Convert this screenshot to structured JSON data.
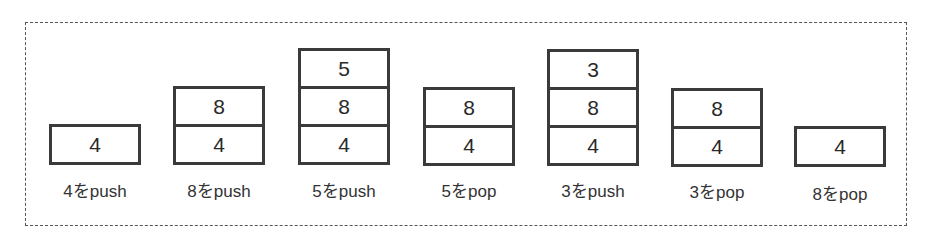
{
  "diagram": {
    "title": "",
    "steps": [
      {
        "label": "4をpush",
        "stack": [
          "4"
        ]
      },
      {
        "label": "8をpush",
        "stack": [
          "8",
          "4"
        ]
      },
      {
        "label": "5をpush",
        "stack": [
          "5",
          "8",
          "4"
        ]
      },
      {
        "label": "5をpop",
        "stack": [
          "8",
          "4"
        ]
      },
      {
        "label": "3をpush",
        "stack": [
          "3",
          "8",
          "4"
        ]
      },
      {
        "label": "3をpop",
        "stack": [
          "8",
          "4"
        ]
      },
      {
        "label": "8をpop",
        "stack": [
          "4"
        ]
      }
    ]
  },
  "colors": {
    "border": "#3a3a3a",
    "frame": "#555555",
    "text": "#2a2a2a"
  }
}
